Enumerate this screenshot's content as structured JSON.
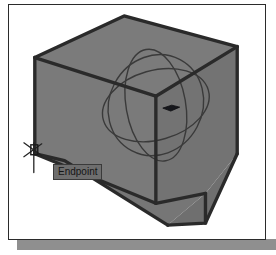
{
  "app": {
    "name": "cad-3d-viewport",
    "title": "3D Modeling Viewport"
  },
  "viewport": {
    "background_color": "#ffffff",
    "frame_color": "#2b2b2b",
    "shadow_color": "#8f8f8f"
  },
  "solid": {
    "name": "3D box solid",
    "face_fill_color": "#787878",
    "face_fill_color_dark": "#6d6d6d",
    "edge_color": "#2a2a2a",
    "edge_width": "3"
  },
  "gizmo": {
    "name": "3d-rotation-gizmo",
    "ring_color": "#3d3d3d",
    "ring_count": "3",
    "handle_color": "#1c1c1c"
  },
  "cursor": {
    "name": "osnap-endpoint-marker",
    "type": "endpoint-snap",
    "color": "#232323"
  },
  "tooltip": {
    "label": "Endpoint",
    "background_color": "#6e6e6e",
    "border_color": "#3a3a3a",
    "text_color": "#151515"
  }
}
